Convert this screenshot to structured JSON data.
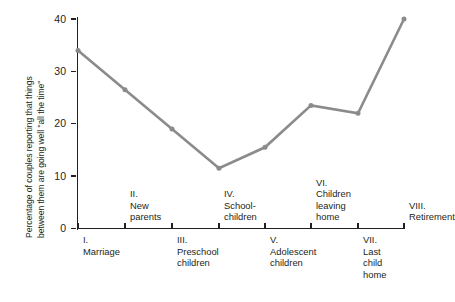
{
  "chart_data": {
    "type": "line",
    "title": "",
    "xlabel": "",
    "ylabel": "Percentage of couples reporting that things between them are going well \"all the time\"",
    "ylabel_line1": "Percentage of couples reporting that things",
    "ylabel_line2": "between them are going well \"all the time\"",
    "ylim": [
      0,
      40
    ],
    "yticks": [
      0,
      10,
      20,
      30,
      40
    ],
    "ytick_labels": [
      "0",
      "10",
      "20",
      "30",
      "40"
    ],
    "grid": false,
    "legend": "none",
    "line_color": "#8b8b8b",
    "marker_color": "#8b8b8b",
    "axis_color": "#231f20",
    "categories": [
      "I. Marriage",
      "II. New parents",
      "III. Preschool children",
      "IV. School-children",
      "V. Adolescent children",
      "VI. Children leaving home",
      "VII. Last child home",
      "VIII. Retirement"
    ],
    "values": [
      34,
      26.5,
      19,
      11.5,
      15.5,
      23.5,
      22,
      40
    ],
    "stages": [
      {
        "numeral": "I.",
        "lines": "Marriage",
        "position": "below",
        "x": 78
      },
      {
        "numeral": "II.",
        "lines": "New\nparents",
        "position": "above",
        "x": 125
      },
      {
        "numeral": "III.",
        "lines": "Preschool\nchildren",
        "position": "below",
        "x": 172
      },
      {
        "numeral": "IV.",
        "lines": "School-\nchildren",
        "position": "above",
        "x": 219
      },
      {
        "numeral": "V.",
        "lines": "Adolescent\nchildren",
        "position": "below",
        "x": 265
      },
      {
        "numeral": "VI.",
        "lines": "Children\nleaving\nhome",
        "position": "above",
        "x": 311
      },
      {
        "numeral": "VII.",
        "lines": "Last\nchild\nhome",
        "position": "below",
        "x": 358
      },
      {
        "numeral": "VIII.",
        "lines": "Retirement",
        "position": "above",
        "x": 404
      }
    ]
  }
}
